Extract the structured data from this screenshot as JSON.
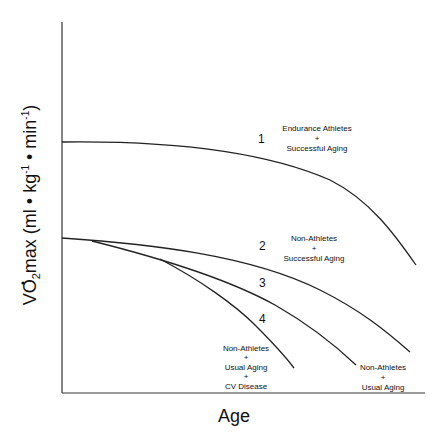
{
  "chart_data": {
    "type": "line",
    "title": "",
    "xlabel": "Age",
    "ylabel": "V̇O2max (ml • kg-1 • min-1)",
    "ylabel_parts": {
      "main": "VO",
      "sub": "2",
      "mid": "max (ml • kg",
      "sup1": "-1",
      "mid2": " • min",
      "sup2": "-1",
      "end": ")"
    },
    "grid": false,
    "ticks": "none",
    "legend": "inline labels",
    "series": [
      {
        "id": "1",
        "name": "Endurance Athletes + Successful Aging",
        "label_lines": [
          "Endurance Athletes",
          "+",
          "Successful Aging"
        ],
        "number": "1",
        "path": "M62,142 C140,141 250,145 330,180 C370,200 395,235 416,265"
      },
      {
        "id": "2",
        "name": "Non-Athletes + Successful Aging",
        "label_lines": [
          "Non-Athletes",
          "+",
          "Successful Aging"
        ],
        "number": "2",
        "path": "M62,238 C150,244 250,255 320,290 C360,310 385,330 410,352"
      },
      {
        "id": "3",
        "name": "Non-Athletes + Usual Aging",
        "label_lines": [
          "Non-Athletes",
          "+",
          "Usual Aging"
        ],
        "number": "3",
        "path": "M92,241 C160,258 230,280 275,305 C310,325 335,345 356,365"
      },
      {
        "id": "4",
        "name": "Non-Athletes + Usual Aging + CV Disease",
        "label_lines": [
          "Non-Athletes",
          "+",
          "Usual Aging",
          "+",
          "CV Disease"
        ],
        "number": "4",
        "path": "M160,259 C200,280 235,305 255,325 C270,340 282,352 294,368"
      }
    ]
  }
}
